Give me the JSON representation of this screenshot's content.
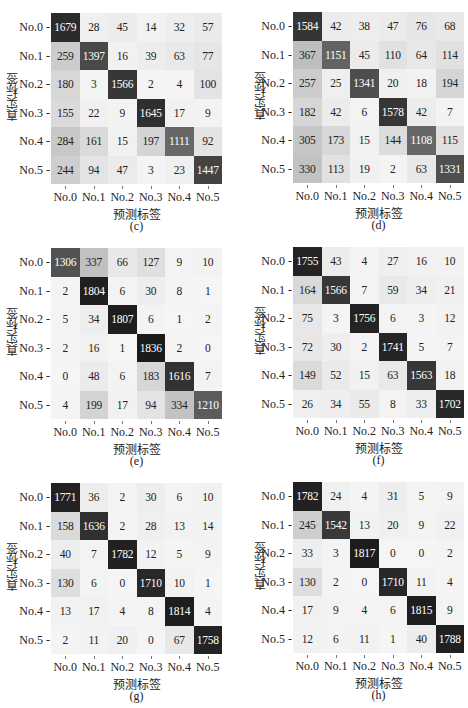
{
  "chart_data": [
    {
      "type": "heatmap",
      "panel": "(c)",
      "xlabel": "预测标签",
      "ylabel": "真实标签",
      "x_categories": [
        "No.0",
        "No.1",
        "No.2",
        "No.3",
        "No.4",
        "No.5"
      ],
      "y_categories": [
        "No.0",
        "No.1",
        "No.2",
        "No.3",
        "No.4",
        "No.5"
      ],
      "matrix": [
        [
          1679,
          28,
          45,
          14,
          32,
          57
        ],
        [
          259,
          1397,
          16,
          39,
          63,
          77
        ],
        [
          180,
          3,
          1566,
          2,
          4,
          100
        ],
        [
          155,
          22,
          9,
          1645,
          17,
          9
        ],
        [
          284,
          161,
          15,
          197,
          1111,
          92
        ],
        [
          244,
          94,
          47,
          3,
          23,
          1447
        ]
      ]
    },
    {
      "type": "heatmap",
      "panel": "(d)",
      "xlabel": "预测标签",
      "ylabel": "真实标签",
      "x_categories": [
        "No.0",
        "No.1",
        "No.2",
        "No.3",
        "No.4",
        "No.5"
      ],
      "y_categories": [
        "No.0",
        "No.1",
        "No.2",
        "No.3",
        "No.4",
        "No.5"
      ],
      "matrix": [
        [
          1584,
          42,
          38,
          47,
          76,
          68
        ],
        [
          367,
          1151,
          45,
          110,
          64,
          114
        ],
        [
          257,
          25,
          1341,
          20,
          18,
          194
        ],
        [
          182,
          42,
          6,
          1578,
          42,
          7
        ],
        [
          305,
          173,
          15,
          144,
          1108,
          115
        ],
        [
          330,
          113,
          19,
          2,
          63,
          1331
        ]
      ]
    },
    {
      "type": "heatmap",
      "panel": "(e)",
      "xlabel": "预测标签",
      "ylabel": "真实标签",
      "x_categories": [
        "No.0",
        "No.1",
        "No.2",
        "No.3",
        "No.4",
        "No.5"
      ],
      "y_categories": [
        "No.0",
        "No.1",
        "No.2",
        "No.3",
        "No.4",
        "No.5"
      ],
      "matrix": [
        [
          1306,
          337,
          66,
          127,
          9,
          10
        ],
        [
          2,
          1804,
          6,
          30,
          8,
          1
        ],
        [
          5,
          34,
          1807,
          6,
          1,
          2
        ],
        [
          2,
          16,
          1,
          1836,
          2,
          0
        ],
        [
          0,
          48,
          6,
          183,
          1616,
          7
        ],
        [
          4,
          199,
          17,
          94,
          334,
          1210
        ]
      ]
    },
    {
      "type": "heatmap",
      "panel": "(f)",
      "xlabel": "预测标签",
      "ylabel": "真实标签",
      "x_categories": [
        "No.0",
        "No.1",
        "No.2",
        "No.3",
        "No.4",
        "No.5"
      ],
      "y_categories": [
        "No.0",
        "No.1",
        "No.2",
        "No.3",
        "No.4",
        "No.5"
      ],
      "matrix": [
        [
          1755,
          43,
          4,
          27,
          16,
          10
        ],
        [
          164,
          1566,
          7,
          59,
          34,
          21
        ],
        [
          75,
          3,
          1756,
          6,
          3,
          12
        ],
        [
          72,
          30,
          2,
          1741,
          5,
          7
        ],
        [
          149,
          52,
          15,
          63,
          1563,
          18
        ],
        [
          26,
          34,
          55,
          8,
          33,
          1702
        ]
      ]
    },
    {
      "type": "heatmap",
      "panel": "(g)",
      "xlabel": "预测标签",
      "ylabel": "真实标签",
      "x_categories": [
        "No.0",
        "No.1",
        "No.2",
        "No.3",
        "No.4",
        "No.5"
      ],
      "y_categories": [
        "No.0",
        "No.1",
        "No.2",
        "No.3",
        "No.4",
        "No.5"
      ],
      "matrix": [
        [
          1771,
          36,
          2,
          30,
          6,
          10
        ],
        [
          158,
          1636,
          2,
          28,
          13,
          14
        ],
        [
          40,
          7,
          1782,
          12,
          5,
          9
        ],
        [
          130,
          6,
          0,
          1710,
          10,
          1
        ],
        [
          13,
          17,
          4,
          8,
          1814,
          4
        ],
        [
          2,
          11,
          20,
          0,
          67,
          1758
        ]
      ]
    },
    {
      "type": "heatmap",
      "panel": "(h)",
      "xlabel": "预测标签",
      "ylabel": "真实标签",
      "x_categories": [
        "No.0",
        "No.1",
        "No.2",
        "No.3",
        "No.4",
        "No.5"
      ],
      "y_categories": [
        "No.0",
        "No.1",
        "No.2",
        "No.3",
        "No.4",
        "No.5"
      ],
      "matrix": [
        [
          1782,
          24,
          4,
          31,
          5,
          9
        ],
        [
          245,
          1542,
          13,
          20,
          9,
          22
        ],
        [
          33,
          3,
          1817,
          0,
          0,
          2
        ],
        [
          130,
          2,
          0,
          1710,
          11,
          4
        ],
        [
          17,
          9,
          4,
          6,
          1815,
          9
        ],
        [
          12,
          6,
          11,
          1,
          40,
          1788
        ]
      ]
    }
  ],
  "layout": {
    "panels": [
      {
        "left": 0,
        "top": 0
      },
      {
        "left": 242,
        "top": 0
      },
      {
        "left": 0,
        "top": 235
      },
      {
        "left": 242,
        "top": 235
      },
      {
        "left": 0,
        "top": 470
      },
      {
        "left": 242,
        "top": 470
      }
    ],
    "grid_offsets": [
      {
        "gx": 51,
        "gy": 13
      },
      {
        "gx": 51,
        "gy": 12
      },
      {
        "gx": 51,
        "gy": 13
      },
      {
        "gx": 51,
        "gy": 12
      },
      {
        "gx": 51,
        "gy": 13
      },
      {
        "gx": 51,
        "gy": 12
      }
    ],
    "colormap": {
      "low": "#f5f5f5",
      "high": "#1a1a1a"
    }
  }
}
